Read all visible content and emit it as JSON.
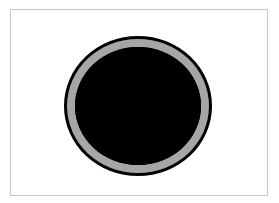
{
  "scene": {
    "description": "Black disc with a gray ring inside a thin light-gray bordered frame",
    "colors": {
      "background": "#ffffff",
      "frame_border": "#c8c8c8",
      "outer_rim": "#000000",
      "ring": "#a6a6a6",
      "core": "#000000"
    },
    "shapes": [
      {
        "type": "frame",
        "x": 10,
        "y": 9,
        "width": 258,
        "height": 187
      },
      {
        "type": "ellipse",
        "role": "outer-rim",
        "cx": 138,
        "cy": 106,
        "rx": 74,
        "ry": 70
      },
      {
        "type": "ellipse",
        "role": "gray-ring",
        "cx": 138,
        "cy": 106,
        "rx": 71,
        "ry": 67
      },
      {
        "type": "ellipse",
        "role": "inner-core",
        "cx": 138,
        "cy": 106,
        "rx": 63,
        "ry": 59
      }
    ]
  }
}
